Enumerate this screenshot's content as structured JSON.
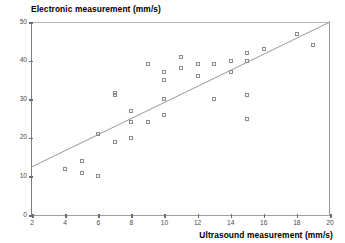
{
  "chart_data": {
    "type": "scatter",
    "title": "",
    "xlabel": "Ultrasound measurement (mm/s)",
    "ylabel": "Electronic measurement (mm/s)",
    "xlim": [
      2,
      20
    ],
    "ylim": [
      0,
      50
    ],
    "xticks": [
      2,
      4,
      6,
      8,
      10,
      12,
      14,
      16,
      18,
      20
    ],
    "yticks": [
      0,
      10,
      20,
      30,
      40,
      50
    ],
    "grid": false,
    "legend": null,
    "marker_style": "open-square",
    "marker_color": "#8c8c8c",
    "points": [
      {
        "x": 4,
        "y": 12
      },
      {
        "x": 5,
        "y": 14
      },
      {
        "x": 5,
        "y": 11
      },
      {
        "x": 6,
        "y": 10
      },
      {
        "x": 6,
        "y": 21
      },
      {
        "x": 7,
        "y": 19
      },
      {
        "x": 7,
        "y": 31
      },
      {
        "x": 7,
        "y": 31.6
      },
      {
        "x": 8,
        "y": 27
      },
      {
        "x": 8,
        "y": 24
      },
      {
        "x": 8,
        "y": 20
      },
      {
        "x": 9,
        "y": 39
      },
      {
        "x": 9,
        "y": 24
      },
      {
        "x": 10,
        "y": 37
      },
      {
        "x": 10,
        "y": 35
      },
      {
        "x": 10,
        "y": 30
      },
      {
        "x": 10,
        "y": 26
      },
      {
        "x": 11,
        "y": 41
      },
      {
        "x": 11,
        "y": 38
      },
      {
        "x": 12,
        "y": 39
      },
      {
        "x": 12,
        "y": 36
      },
      {
        "x": 13,
        "y": 39
      },
      {
        "x": 13,
        "y": 30
      },
      {
        "x": 14,
        "y": 40
      },
      {
        "x": 14,
        "y": 37
      },
      {
        "x": 15,
        "y": 42
      },
      {
        "x": 15,
        "y": 40
      },
      {
        "x": 15,
        "y": 31
      },
      {
        "x": 15,
        "y": 25
      },
      {
        "x": 16,
        "y": 43
      },
      {
        "x": 18,
        "y": 47
      },
      {
        "x": 19,
        "y": 44
      }
    ],
    "trendline": {
      "type": "linear-fit",
      "x_start": 2,
      "y_start": 12.5,
      "x_end": 20,
      "y_end": 50,
      "color": "#8c8c8c"
    }
  }
}
